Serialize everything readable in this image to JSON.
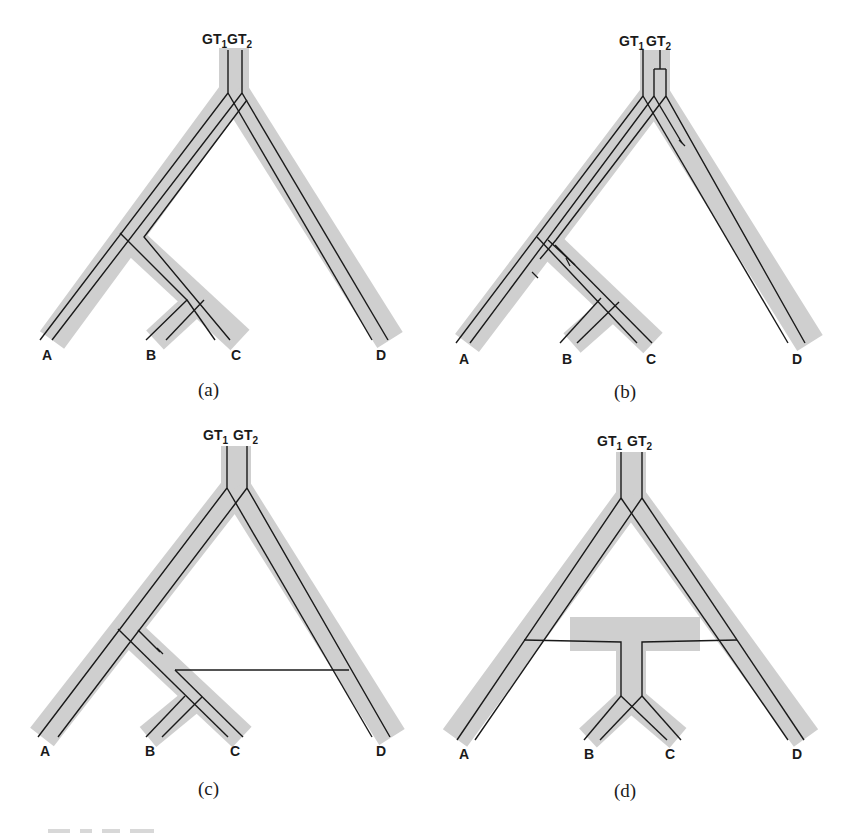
{
  "figure": {
    "colors": {
      "species_tree": "#cfcfcf",
      "gene_tree": "#1a1a1a",
      "background": "#ffffff"
    },
    "panels": [
      {
        "id": "a",
        "caption": "(a)",
        "gene_labels": [
          "GT",
          "1",
          "GT",
          "2"
        ],
        "taxa": [
          "A",
          "B",
          "C",
          "D"
        ],
        "scenario": "incomplete lineage sorting"
      },
      {
        "id": "b",
        "caption": "(b)",
        "gene_labels": [
          "GT",
          "1",
          "GT",
          "2"
        ],
        "taxa": [
          "A",
          "B",
          "C",
          "D"
        ],
        "scenario": "gene duplication and loss"
      },
      {
        "id": "c",
        "caption": "(c)",
        "gene_labels": [
          "GT",
          "1",
          "GT",
          "2"
        ],
        "taxa": [
          "A",
          "B",
          "C",
          "D"
        ],
        "scenario": "horizontal gene transfer"
      },
      {
        "id": "d",
        "caption": "(d)",
        "gene_labels": [
          "GT",
          "1",
          "GT",
          "2"
        ],
        "taxa": [
          "A",
          "B",
          "C",
          "D"
        ],
        "scenario": "hybridization"
      }
    ]
  }
}
